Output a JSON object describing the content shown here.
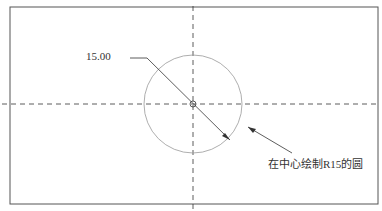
{
  "diagram": {
    "dimension_label": "15.00",
    "annotation": "在中心绘制R15的圆",
    "colors": {
      "border": "#555555",
      "centerline": "#333333",
      "circle": "#999999",
      "leader": "#333333"
    }
  }
}
